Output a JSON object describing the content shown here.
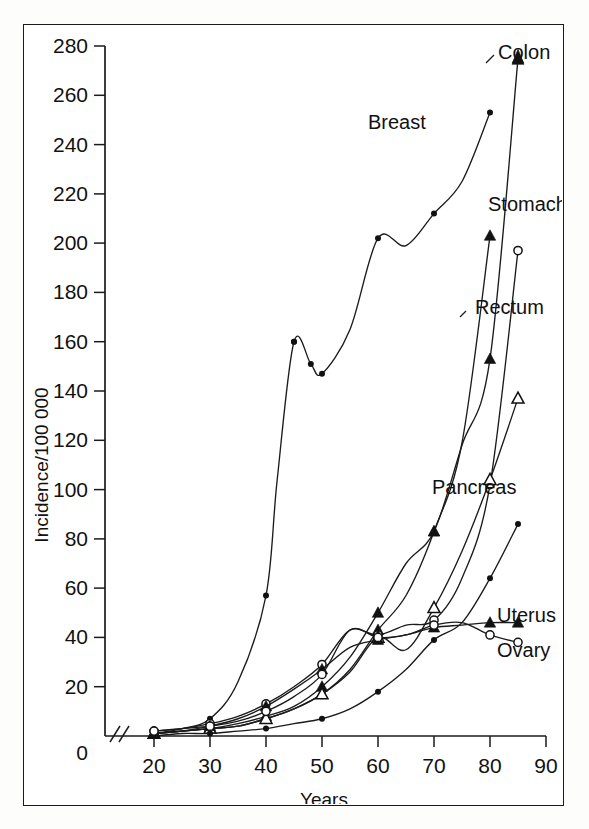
{
  "figure": {
    "background_color": "#ffffff",
    "frame_color": "#1a1a1a",
    "ink_color": "#111111"
  },
  "axes": {
    "y_title": "Incidence/100 000",
    "x_title": "Years",
    "y_ticks": [
      "0",
      "20",
      "40",
      "60",
      "80",
      "100",
      "120",
      "140",
      "160",
      "180",
      "200",
      "220",
      "240",
      "260",
      "280"
    ],
    "x_ticks": [
      "20",
      "30",
      "40",
      "50",
      "60",
      "70",
      "80",
      "90"
    ],
    "y_break_note": "axis break between 0 and 20 on both axes"
  },
  "labels": {
    "colon": "Colon",
    "breast": "Breast",
    "stomach": "Stomach",
    "rectum": "Rectum",
    "pancreas": "Pancreas",
    "uterus": "Uterus",
    "ovary": "Ovary"
  },
  "chart_data": {
    "type": "line",
    "title": "",
    "xlabel": "Years",
    "ylabel": "Incidence/100 000",
    "xlim": [
      15,
      92
    ],
    "ylim": [
      0,
      280
    ],
    "xticks": [
      20,
      30,
      40,
      50,
      60,
      70,
      80,
      90
    ],
    "yticks": [
      0,
      20,
      40,
      60,
      80,
      100,
      120,
      140,
      160,
      180,
      200,
      220,
      240,
      260,
      280
    ],
    "grid": false,
    "legend": "inline labels at curve ends (right side)",
    "axis_break": true,
    "series": [
      {
        "name": "Colon",
        "marker": "filled-triangle",
        "x": [
          20,
          25,
          30,
          35,
          40,
          45,
          50,
          55,
          60,
          65,
          70,
          75,
          80,
          85
        ],
        "values": [
          1,
          2,
          3,
          5,
          8,
          12,
          20,
          32,
          50,
          70,
          83,
          118,
          153,
          275
        ]
      },
      {
        "name": "Breast",
        "marker": "filled-circle",
        "x": [
          20,
          25,
          30,
          35,
          40,
          42,
          45,
          48,
          50,
          55,
          60,
          65,
          70,
          75,
          80
        ],
        "values": [
          1,
          3,
          7,
          22,
          57,
          104,
          160,
          151,
          147,
          165,
          202,
          199,
          212,
          225,
          253
        ]
      },
      {
        "name": "Stomach",
        "marker": "filled-triangle",
        "x": [
          20,
          25,
          30,
          35,
          40,
          45,
          50,
          55,
          60,
          65,
          70,
          75,
          80
        ],
        "values": [
          1,
          2,
          3,
          4,
          7,
          11,
          17,
          27,
          43,
          57,
          83,
          119,
          203
        ]
      },
      {
        "name": "Rectum",
        "marker": "open-circle",
        "x": [
          20,
          25,
          30,
          35,
          40,
          45,
          50,
          55,
          60,
          65,
          70,
          75,
          80,
          85
        ],
        "values": [
          2,
          3,
          5,
          8,
          13,
          20,
          29,
          43,
          41,
          45,
          47,
          64,
          102,
          197
        ]
      },
      {
        "name": "Rectum2",
        "marker": "open-triangle",
        "x": [
          20,
          25,
          30,
          35,
          40,
          45,
          50,
          55,
          60,
          65,
          70,
          75,
          80,
          85
        ],
        "values": [
          1,
          2,
          3,
          4,
          7,
          11,
          17,
          26,
          40,
          35,
          52,
          75,
          104,
          137
        ]
      },
      {
        "name": "Pancreas",
        "marker": "filled-circle",
        "x": [
          20,
          25,
          30,
          35,
          40,
          45,
          50,
          55,
          60,
          65,
          70,
          75,
          80,
          85
        ],
        "values": [
          0,
          1,
          1,
          2,
          3,
          5,
          7,
          11,
          18,
          27,
          39,
          46,
          64,
          86
        ]
      },
      {
        "name": "Uterus",
        "marker": "filled-triangle",
        "x": [
          20,
          25,
          30,
          35,
          40,
          45,
          50,
          55,
          60,
          65,
          70,
          75,
          80,
          85
        ],
        "values": [
          1,
          2,
          4,
          7,
          12,
          19,
          27,
          36,
          39,
          41,
          44,
          45,
          46,
          46
        ]
      },
      {
        "name": "Ovary",
        "marker": "open-circle",
        "x": [
          20,
          25,
          30,
          35,
          40,
          45,
          50,
          55,
          60,
          65,
          70,
          75,
          80,
          85
        ],
        "values": [
          2,
          3,
          4,
          6,
          10,
          16,
          25,
          43,
          40,
          41,
          45,
          46,
          41,
          38
        ]
      }
    ],
    "scatter_extra": [
      {
        "series": "Breast",
        "x": 45,
        "y": 160
      },
      {
        "series": "Breast",
        "x": 48,
        "y": 151
      }
    ]
  }
}
